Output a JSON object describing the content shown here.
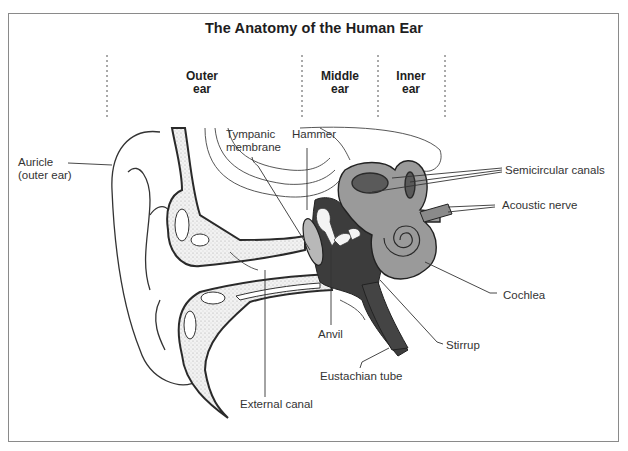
{
  "title": "The Anatomy of the Human Ear",
  "sections": [
    {
      "id": "outer",
      "line1": "Outer",
      "line2": "ear"
    },
    {
      "id": "middle",
      "line1": "Middle",
      "line2": "ear"
    },
    {
      "id": "inner",
      "line1": "Inner",
      "line2": "ear"
    }
  ],
  "labels": {
    "auricle_line1": "Auricle",
    "auricle_line2": "(outer ear)",
    "tympanic_line1": "Tympanic",
    "tympanic_line2": "membrane",
    "hammer": "Hammer",
    "semicircular_canals": "Semicircular canals",
    "acoustic_nerve": "Acoustic nerve",
    "cochlea": "Cochlea",
    "stirrup": "Stirrup",
    "anvil": "Anvil",
    "eustachian_tube": "Eustachian tube",
    "external_canal": "External canal"
  },
  "colors": {
    "frame": "#8a8a8a",
    "outline": "#333333",
    "inner_ear_fill": "#9a9a9a",
    "middle_ear_fill": "#3c3c3c",
    "bone_stipple": "#e6e6e6"
  }
}
